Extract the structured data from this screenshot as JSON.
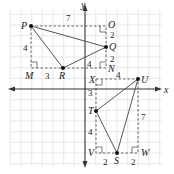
{
  "axes": {
    "x_label": "x",
    "y_label": "y",
    "unit_px": 10.67,
    "origin_px": [
      85,
      89
    ]
  },
  "triangles": [
    {
      "name": "PQR",
      "vertices": [
        "P",
        "Q",
        "R"
      ]
    },
    {
      "name": "STU",
      "vertices": [
        "S",
        "T",
        "U"
      ]
    }
  ],
  "points": {
    "P": {
      "label": "P",
      "coord": [
        -5,
        6
      ]
    },
    "Q": {
      "label": "Q",
      "coord": [
        2,
        4
      ]
    },
    "R": {
      "label": "R",
      "coord": [
        -2,
        2
      ]
    },
    "M": {
      "label": "M",
      "coord": [
        -5,
        2
      ]
    },
    "O": {
      "label": "O",
      "coord": [
        2,
        6
      ]
    },
    "N": {
      "label": "N",
      "coord": [
        2,
        2
      ]
    },
    "U": {
      "label": "U",
      "coord": [
        5,
        1
      ]
    },
    "T": {
      "label": "T",
      "coord": [
        1,
        -2
      ]
    },
    "S": {
      "label": "S",
      "coord": [
        3,
        -6
      ]
    },
    "X": {
      "label": "X",
      "coord": [
        1,
        1
      ]
    },
    "V": {
      "label": "V",
      "coord": [
        1,
        -6
      ]
    },
    "W": {
      "label": "W",
      "coord": [
        5,
        -6
      ]
    }
  },
  "measures": {
    "PO": "7",
    "PM": "4",
    "MR": "3",
    "OQ": "2",
    "QN": "2",
    "RN": "4",
    "XU": "4",
    "XT": "3",
    "TV": "4",
    "VS": "2",
    "SW": "2",
    "UW": "7"
  }
}
